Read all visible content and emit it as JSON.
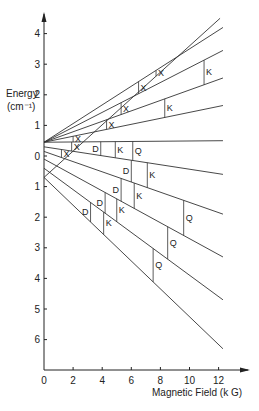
{
  "chart_data": {
    "type": "line",
    "title": "",
    "xlabel": "Magnetic Field (k G)",
    "ylabel": "Energy (cm⁻¹)",
    "ylabel_line1": "Energy",
    "ylabel_line2": "(cm⁻¹)",
    "xlim": [
      0,
      13.5
    ],
    "ylim": [
      -7,
      4.5
    ],
    "grid": false,
    "legend": null,
    "x_ticks": [
      0,
      2,
      4,
      6,
      8,
      10,
      12
    ],
    "x_tick_labels": [
      "0",
      "2",
      "4",
      "6",
      "8",
      "10",
      "12"
    ],
    "y_ticks": [
      4,
      3,
      2,
      1,
      0,
      -1,
      -2,
      -3,
      -4,
      -5,
      -6
    ],
    "y_tick_labels": [
      "4",
      "3",
      "2",
      "1",
      "0",
      "1",
      "2",
      "3",
      "4",
      "5",
      "6"
    ],
    "series": [
      {
        "name": "level-1",
        "x": [
          0,
          12.1
        ],
        "y": [
          -0.7,
          4.5
        ]
      },
      {
        "name": "level-2",
        "x": [
          0,
          12.3
        ],
        "y": [
          0.45,
          4.2
        ]
      },
      {
        "name": "level-3",
        "x": [
          0,
          12.3
        ],
        "y": [
          0.45,
          3.45
        ]
      },
      {
        "name": "level-4",
        "x": [
          0,
          12.3
        ],
        "y": [
          0.45,
          2.55
        ]
      },
      {
        "name": "level-5",
        "x": [
          0,
          12.3
        ],
        "y": [
          0.45,
          1.65
        ]
      },
      {
        "name": "level-6",
        "x": [
          0,
          12.3
        ],
        "y": [
          0.45,
          0.5
        ]
      },
      {
        "name": "level-7",
        "x": [
          0,
          12.3
        ],
        "y": [
          0.3,
          -0.6
        ]
      },
      {
        "name": "level-8",
        "x": [
          0,
          12.3
        ],
        "y": [
          0.15,
          -1.9
        ]
      },
      {
        "name": "level-9",
        "x": [
          0,
          12.3
        ],
        "y": [
          -0.1,
          -3.3
        ]
      },
      {
        "name": "level-10",
        "x": [
          0,
          12.3
        ],
        "y": [
          -0.4,
          -4.7
        ]
      },
      {
        "name": "level-11",
        "x": [
          0,
          12.3
        ],
        "y": [
          -0.7,
          -6.3
        ]
      }
    ],
    "annotations": [
      {
        "text": "X",
        "x": 7.7,
        "from": "level-2",
        "to": "level-1"
      },
      {
        "text": "X",
        "x": 6.5,
        "from": "level-3",
        "to": "level-2"
      },
      {
        "text": "X",
        "x": 5.3,
        "from": "level-4",
        "to": "level-3"
      },
      {
        "text": "X",
        "x": 4.3,
        "from": "level-5",
        "to": "level-4"
      },
      {
        "text": "X",
        "x": 2.0,
        "from": "level-6",
        "to": "level-5"
      },
      {
        "text": "X",
        "x": 1.9,
        "from": "level-7",
        "to": "level-6"
      },
      {
        "text": "X",
        "x": 1.2,
        "from": "level-8",
        "to": "level-7"
      },
      {
        "text": "K",
        "x": 11.0,
        "from": "level-4",
        "to": "level-3"
      },
      {
        "text": "K",
        "x": 8.3,
        "from": "level-5",
        "to": "level-4"
      },
      {
        "text": "D",
        "x": 3.9,
        "from": "level-7",
        "to": "level-6"
      },
      {
        "text": "K",
        "x": 4.9,
        "from": "level-7",
        "to": "level-6"
      },
      {
        "text": "Q",
        "x": 6.1,
        "from": "level-7",
        "to": "level-6"
      },
      {
        "text": "D",
        "x": 6.0,
        "from": "level-8",
        "to": "level-7"
      },
      {
        "text": "K",
        "x": 7.1,
        "from": "level-8",
        "to": "level-7"
      },
      {
        "text": "D",
        "x": 5.3,
        "from": "level-9",
        "to": "level-8"
      },
      {
        "text": "K",
        "x": 6.2,
        "from": "level-9",
        "to": "level-8"
      },
      {
        "text": "Q",
        "x": 9.6,
        "from": "level-9",
        "to": "level-8"
      },
      {
        "text": "D",
        "x": 4.2,
        "from": "level-10",
        "to": "level-9"
      },
      {
        "text": "K",
        "x": 5.0,
        "from": "level-10",
        "to": "level-9"
      },
      {
        "text": "Q",
        "x": 8.5,
        "from": "level-10",
        "to": "level-9"
      },
      {
        "text": "D",
        "x": 3.2,
        "from": "level-11",
        "to": "level-10"
      },
      {
        "text": "K",
        "x": 4.1,
        "from": "level-11",
        "to": "level-10"
      },
      {
        "text": "Q",
        "x": 7.5,
        "from": "level-11",
        "to": "level-10"
      }
    ],
    "colors": {
      "line": "#333333",
      "axis": "#222222"
    }
  }
}
